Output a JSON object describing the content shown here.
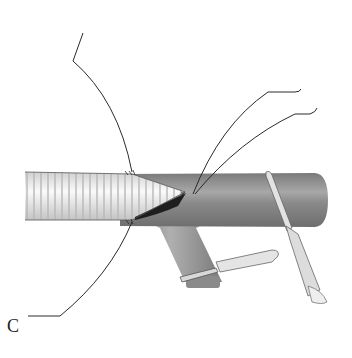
{
  "figure": {
    "panel_label": "C",
    "colors": {
      "background": "#ffffff",
      "vessel": "#8c8c8c",
      "vessel_highlight": "#b5b5b5",
      "graft": "#e6e6e6",
      "suture": "#2a2a2a",
      "clamp": "#d9d9d9"
    }
  }
}
